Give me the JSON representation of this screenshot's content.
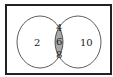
{
  "diagram": {
    "type": "venn",
    "sets": [
      {
        "name": "left",
        "only_values": [
          "2"
        ]
      },
      {
        "name": "right",
        "only_values": [
          "10"
        ]
      }
    ],
    "intersection_values": [
      "4",
      "6",
      "8"
    ],
    "labels": {
      "left_only": "2",
      "intersection_1": "4",
      "intersection_2": "6",
      "intersection_3": "8",
      "right_only": "10"
    },
    "colors": {
      "intersection_fill": "#a8a8a8",
      "stroke": "#222222",
      "background": "#ffffff"
    }
  }
}
